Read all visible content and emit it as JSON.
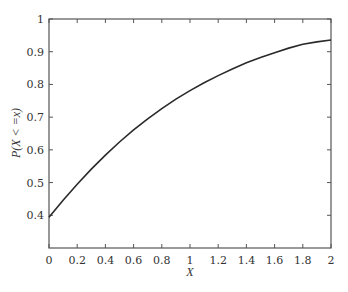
{
  "chart_data": {
    "type": "line",
    "title": "",
    "xlabel": "X",
    "ylabel": "P(X < =x)",
    "xlim": [
      0,
      2
    ],
    "ylim": [
      0.3,
      1
    ],
    "x_ticks": [
      0,
      0.2,
      0.4,
      0.6,
      0.8,
      1,
      1.2,
      1.4,
      1.6,
      1.8,
      2
    ],
    "x_tick_labels": [
      "0",
      "0.2",
      "0.4",
      "0.6",
      "0.8",
      "1",
      "1.2",
      "1.4",
      "1.6",
      "1.8",
      "2"
    ],
    "y_ticks": [
      0.4,
      0.5,
      0.6,
      0.7,
      0.8,
      0.9,
      1
    ],
    "y_tick_labels": [
      "0.4",
      "0.5",
      "0.6",
      "0.7",
      "0.8",
      "0.9",
      "1"
    ],
    "grid": false,
    "legend": null,
    "series": [
      {
        "name": "P(X<=x)",
        "color": "#2a2a2a",
        "x": [
          0,
          0.1,
          0.2,
          0.3,
          0.4,
          0.5,
          0.6,
          0.7,
          0.8,
          0.9,
          1.0,
          1.1,
          1.2,
          1.3,
          1.4,
          1.5,
          1.6,
          1.7,
          1.8,
          1.9,
          2.0
        ],
        "y": [
          0.394,
          0.446,
          0.495,
          0.541,
          0.584,
          0.624,
          0.661,
          0.695,
          0.726,
          0.755,
          0.781,
          0.805,
          0.827,
          0.847,
          0.866,
          0.882,
          0.897,
          0.911,
          0.923,
          0.93,
          0.936
        ]
      }
    ]
  }
}
